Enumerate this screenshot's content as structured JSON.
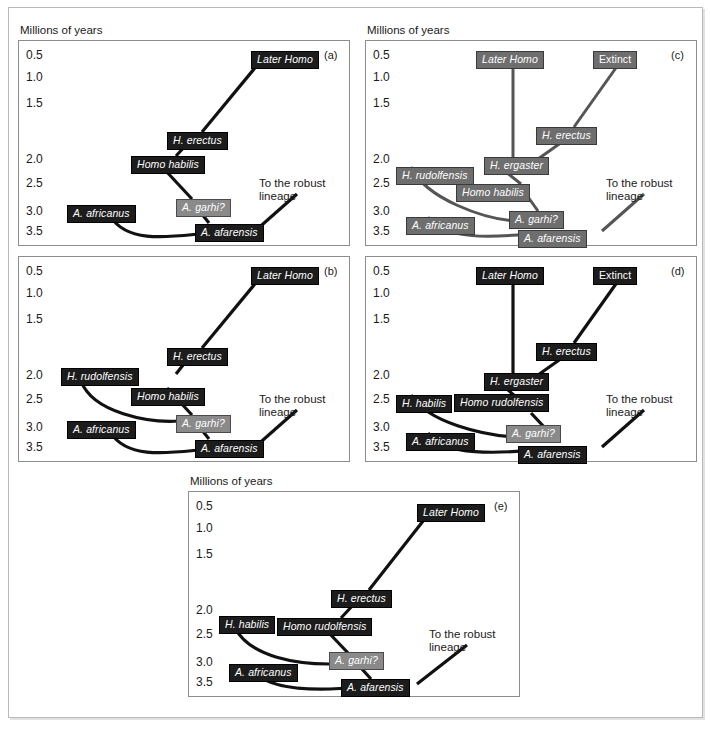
{
  "figure": {
    "caption_sliver": "",
    "axis_label": "Millions of years",
    "tick_labels": [
      "0.5",
      "1.0",
      "1.5",
      "2.0",
      "2.5",
      "3.0",
      "3.5"
    ],
    "robust_note_line1": "To the robust",
    "robust_note_line2": "lineage",
    "colors": {
      "box_dark": "#1c1c1c",
      "box_gray": "#6e6e6e",
      "box_light_gray": "#8a8a8a",
      "frame": "#8d8d8d",
      "outer_frame": "#b9b9b9",
      "text": "#1a1a1a",
      "box_text": "#ffffff"
    }
  },
  "panels": [
    {
      "id": "a",
      "letter": "(a)",
      "style": "dark",
      "axis_label": "Millions of years",
      "ticks": [
        "0.5",
        "1.0",
        "1.5",
        "2.0",
        "2.5",
        "3.0",
        "3.5"
      ],
      "robust_note_line1": "To the robust",
      "robust_note_line2": "lineage",
      "taxa": [
        {
          "name": "Later Homo",
          "shade": "dark"
        },
        {
          "name": "H. erectus",
          "shade": "dark"
        },
        {
          "name": "Homo habilis",
          "shade": "dark"
        },
        {
          "name": "A. garhi?",
          "shade": "light"
        },
        {
          "name": "A. africanus",
          "shade": "dark"
        },
        {
          "name": "A. afarensis",
          "shade": "dark"
        }
      ]
    },
    {
      "id": "b",
      "letter": "(b)",
      "style": "dark",
      "ticks": [
        "0.5",
        "1.0",
        "1.5",
        "2.0",
        "2.5",
        "3.0",
        "3.5"
      ],
      "robust_note_line1": "To the robust",
      "robust_note_line2": "lineage",
      "taxa": [
        {
          "name": "Later Homo",
          "shade": "dark"
        },
        {
          "name": "H. erectus",
          "shade": "dark"
        },
        {
          "name": "H. rudolfensis",
          "shade": "dark"
        },
        {
          "name": "Homo habilis",
          "shade": "dark"
        },
        {
          "name": "A. garhi?",
          "shade": "light"
        },
        {
          "name": "A. africanus",
          "shade": "dark"
        },
        {
          "name": "A. afarensis",
          "shade": "dark"
        }
      ]
    },
    {
      "id": "c",
      "letter": "(c)",
      "style": "gray",
      "axis_label": "Millions of years",
      "ticks": [
        "0.5",
        "1.0",
        "1.5",
        "2.0",
        "2.5",
        "3.0",
        "3.5"
      ],
      "robust_note_line1": "To the robust",
      "robust_note_line2": "lineage",
      "taxa": [
        {
          "name": "Later Homo",
          "shade": "gray"
        },
        {
          "name": "Extinct",
          "shade": "gray"
        },
        {
          "name": "H. erectus",
          "shade": "gray"
        },
        {
          "name": "H. ergaster",
          "shade": "gray"
        },
        {
          "name": "H. rudolfensis",
          "shade": "gray"
        },
        {
          "name": "Homo habilis",
          "shade": "gray"
        },
        {
          "name": "A. garhi?",
          "shade": "gray"
        },
        {
          "name": "A. africanus",
          "shade": "gray"
        },
        {
          "name": "A. afarensis",
          "shade": "gray"
        }
      ]
    },
    {
      "id": "d",
      "letter": "(d)",
      "style": "dark",
      "ticks": [
        "0.5",
        "1.0",
        "1.5",
        "2.0",
        "2.5",
        "3.0",
        "3.5"
      ],
      "robust_note_line1": "To the robust",
      "robust_note_line2": "lineage",
      "taxa": [
        {
          "name": "Later Homo",
          "shade": "dark"
        },
        {
          "name": "Extinct",
          "shade": "dark"
        },
        {
          "name": "H. erectus",
          "shade": "dark"
        },
        {
          "name": "H. ergaster",
          "shade": "dark"
        },
        {
          "name": "H. habilis",
          "shade": "dark"
        },
        {
          "name": "Homo rudolfensis",
          "shade": "dark"
        },
        {
          "name": "A. garhi?",
          "shade": "light"
        },
        {
          "name": "A. africanus",
          "shade": "dark"
        },
        {
          "name": "A. afarensis",
          "shade": "dark"
        }
      ]
    },
    {
      "id": "e",
      "letter": "(e)",
      "style": "dark",
      "axis_label": "Millions of years",
      "ticks": [
        "0.5",
        "1.0",
        "1.5",
        "2.0",
        "2.5",
        "3.0",
        "3.5"
      ],
      "robust_note_line1": "To the robust",
      "robust_note_line2": "lineage",
      "taxa": [
        {
          "name": "Later Homo",
          "shade": "dark"
        },
        {
          "name": "H. erectus",
          "shade": "dark"
        },
        {
          "name": "H. habilis",
          "shade": "dark"
        },
        {
          "name": "Homo rudolfensis",
          "shade": "dark"
        },
        {
          "name": "A. garhi?",
          "shade": "light"
        },
        {
          "name": "A. africanus",
          "shade": "dark"
        },
        {
          "name": "A. afarensis",
          "shade": "dark"
        }
      ]
    }
  ]
}
